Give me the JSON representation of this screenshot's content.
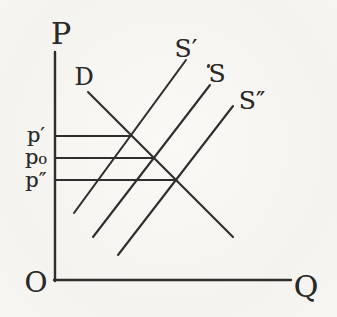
{
  "figure": {
    "colors": {
      "background": "#f5f4f0",
      "line": "#2f2e2c",
      "text": "#2a2927"
    },
    "axis_labels": {
      "price_axis": "P",
      "quantity_axis": "Q",
      "origin": "O"
    },
    "curve_labels": {
      "demand": "D",
      "supply_prime": "S′",
      "supply": "S",
      "supply_double_prime": "S″"
    },
    "price_labels": {
      "p_prime": "p′",
      "p_zero": "p₀",
      "p_double_prime": "p″"
    }
  },
  "chart_data": {
    "type": "line",
    "title": "",
    "xlabel": "Q",
    "ylabel": "P",
    "axis_ranges": {
      "x_px": [
        55,
        291
      ],
      "y_px": [
        281,
        52
      ]
    },
    "lines": [
      {
        "name": "price-axis",
        "role": "axis",
        "points": [
          [
            55,
            52
          ],
          [
            55,
            281
          ]
        ]
      },
      {
        "name": "quantity-axis",
        "role": "axis",
        "points": [
          [
            54,
            280
          ],
          [
            291,
            280
          ]
        ]
      },
      {
        "name": "demand-curve-D",
        "role": "curve",
        "points": [
          [
            88,
            92
          ],
          [
            233,
            237
          ]
        ]
      },
      {
        "name": "supply-curve-S-prime",
        "role": "curve",
        "points": [
          [
            74,
            213
          ],
          [
            186,
            60
          ]
        ]
      },
      {
        "name": "supply-curve-S",
        "role": "curve",
        "points": [
          [
            93,
            237
          ],
          [
            210,
            85
          ]
        ]
      },
      {
        "name": "supply-curve-S-double-prime",
        "role": "curve",
        "points": [
          [
            118,
            255
          ],
          [
            233,
            106
          ]
        ]
      },
      {
        "name": "price-guide-p-prime",
        "role": "guide",
        "points": [
          [
            56,
            136
          ],
          [
            131,
            136
          ]
        ]
      },
      {
        "name": "price-guide-p-zero",
        "role": "guide",
        "points": [
          [
            56,
            158
          ],
          [
            154,
            158
          ]
        ]
      },
      {
        "name": "price-guide-p-double-prime",
        "role": "guide",
        "points": [
          [
            56,
            180
          ],
          [
            176,
            180
          ]
        ]
      }
    ],
    "intersections": [
      {
        "curves": [
          "D",
          "S′"
        ],
        "price_label": "p′",
        "point_px": [
          131,
          136
        ]
      },
      {
        "curves": [
          "D",
          "S"
        ],
        "price_label": "p₀",
        "point_px": [
          154,
          158
        ]
      },
      {
        "curves": [
          "D",
          "S″"
        ],
        "price_label": "p″",
        "point_px": [
          176,
          180
        ]
      }
    ]
  }
}
